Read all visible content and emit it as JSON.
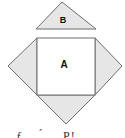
{
  "diagram": {
    "labels": {
      "square": "A",
      "triangle": "B"
    },
    "colors": {
      "fill_shaded": "#e6e6e6",
      "fill_square": "#ffffff",
      "stroke": "#6e6e6e",
      "label": "#111111"
    },
    "shapes": {
      "triangle_b": {
        "points": "62,2 36,29 96,29"
      },
      "square_a": {
        "x": 37,
        "y": 38,
        "width": 58,
        "height": 57
      },
      "left_triangle": {
        "points": "37,38 8,66 37,95"
      },
      "right_triangle": {
        "points": "95,38 122,66 95,95"
      },
      "bottom_triangle": {
        "points": "37,95 95,95 66,124"
      }
    },
    "caption_partial": "... ƒ ... ́ ... P! ..."
  }
}
